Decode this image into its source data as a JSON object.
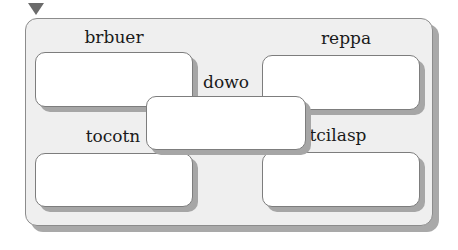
{
  "diagram": {
    "marker": "triangle-down",
    "frame_color": "#efefef",
    "box_color": "#ffffff",
    "shadow_color": "#a9a9a9",
    "nodes": [
      {
        "id": "top-left",
        "label": "brbuer"
      },
      {
        "id": "top-right",
        "label": "reppa"
      },
      {
        "id": "center",
        "label": "dowo"
      },
      {
        "id": "bottom-left",
        "label": "tocotn"
      },
      {
        "id": "bottom-right",
        "label": "tcilasp"
      }
    ]
  }
}
